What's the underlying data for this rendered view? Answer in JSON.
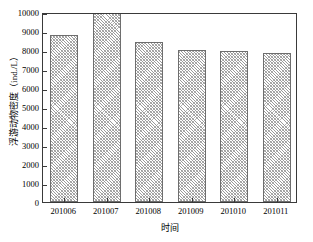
{
  "chart_data": {
    "type": "bar",
    "title": "",
    "xlabel": "时间",
    "ylabel": "浮游动物密度（ind./L）",
    "categories": [
      "201006",
      "201007",
      "201008",
      "201009",
      "201010",
      "201011"
    ],
    "values": [
      8790,
      9930,
      8420,
      8000,
      7970,
      7820
    ],
    "ylim": [
      0,
      10000
    ],
    "ytick_labels": [
      "0",
      "1000",
      "2000",
      "3000",
      "4000",
      "5000",
      "6000",
      "7000",
      "8000",
      "9000",
      "10000"
    ],
    "ytick_values": [
      0,
      1000,
      2000,
      3000,
      4000,
      5000,
      6000,
      7000,
      8000,
      9000,
      10000
    ],
    "grid": false,
    "legend": null,
    "bar_fill": "diagonal-hatch-gray",
    "bar_edge_color": "#6e6e6e",
    "frame_color": "#3a3a3a",
    "background_color": "#ffffff"
  }
}
